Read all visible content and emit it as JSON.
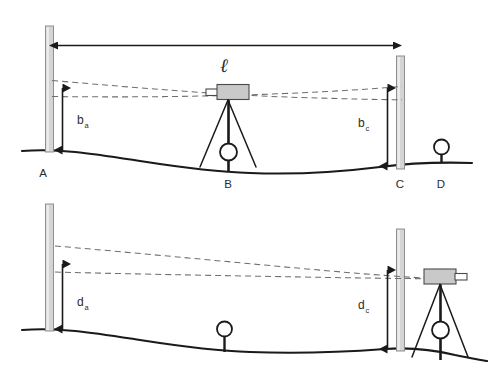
{
  "figure": {
    "colors": {
      "ink": "#1a1a1a",
      "sight_line": "#6e6e6e",
      "staff_fill": "#d4d4d4",
      "staff_stroke": "#8f8f8f",
      "instrument_fill": "#c9c9c9",
      "background": "#ffffff"
    }
  },
  "panels": [
    {
      "id": "top",
      "name": "instrument-midway-panel",
      "dimension_label": "ℓ",
      "staff_left_label": "A",
      "staff_right_label": "C",
      "instrument_label": "B",
      "benchmark_label": "D",
      "reading_left": "b",
      "reading_left_sub": "a",
      "reading_right": "b",
      "reading_right_sub": "c"
    },
    {
      "id": "bottom",
      "name": "instrument-beyond-panel",
      "staff_left_label": "A",
      "staff_right_label": "C",
      "reading_left": "d",
      "reading_left_sub": "a",
      "reading_right": "d",
      "reading_right_sub": "c"
    }
  ],
  "labels": {
    "point_a_top": "A",
    "point_b_top": "B",
    "point_c_top": "C",
    "point_d_top": "D",
    "baseline_length": "ℓ",
    "reading_ba_main": "b",
    "reading_ba_sub": "a",
    "reading_bc_main": "b",
    "reading_bc_sub": "c",
    "reading_da_main": "d",
    "reading_da_sub": "a",
    "reading_dc_main": "d",
    "reading_dc_sub": "c"
  }
}
